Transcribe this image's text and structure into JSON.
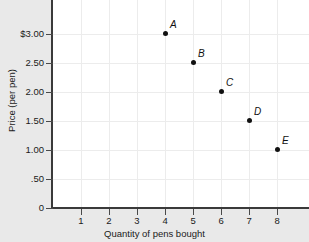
{
  "chart_data": {
    "type": "scatter",
    "title": "",
    "xlabel": "Quantity of pens bought",
    "ylabel": "Price (per pen)",
    "xlim": [
      0,
      9.14
    ],
    "ylim": [
      0,
      3.586
    ],
    "grid": true,
    "legend": "none",
    "x": [
      4,
      5,
      6,
      7,
      8
    ],
    "values": [
      3.0,
      2.5,
      2.0,
      1.5,
      1.0
    ],
    "point_labels": [
      "A",
      "B",
      "C",
      "D",
      "E"
    ],
    "points": [
      {
        "label": "A",
        "x": 4,
        "y": 3.0
      },
      {
        "label": "B",
        "x": 5,
        "y": 2.5
      },
      {
        "label": "C",
        "x": 6,
        "y": 2.0
      },
      {
        "label": "D",
        "x": 7,
        "y": 1.5
      },
      {
        "label": "E",
        "x": 8,
        "y": 1.0
      }
    ],
    "xticks": [
      1,
      2,
      3,
      4,
      5,
      6,
      7,
      8
    ],
    "xtick_labels": [
      "1",
      "2",
      "3",
      "4",
      "5",
      "6",
      "7",
      "8"
    ],
    "yticks": [
      0,
      0.5,
      1.0,
      1.5,
      2.0,
      2.5,
      3.0
    ],
    "ytick_labels": [
      "0",
      ".50",
      "1.00",
      "1.50",
      "2.00",
      "2.50",
      "$3.00"
    ],
    "colors": {
      "point": "#111111",
      "axis": "#3a3a3a",
      "grid": "#ececec",
      "plot_background": "#ffffff",
      "page_background": "#e9e9e9"
    }
  }
}
